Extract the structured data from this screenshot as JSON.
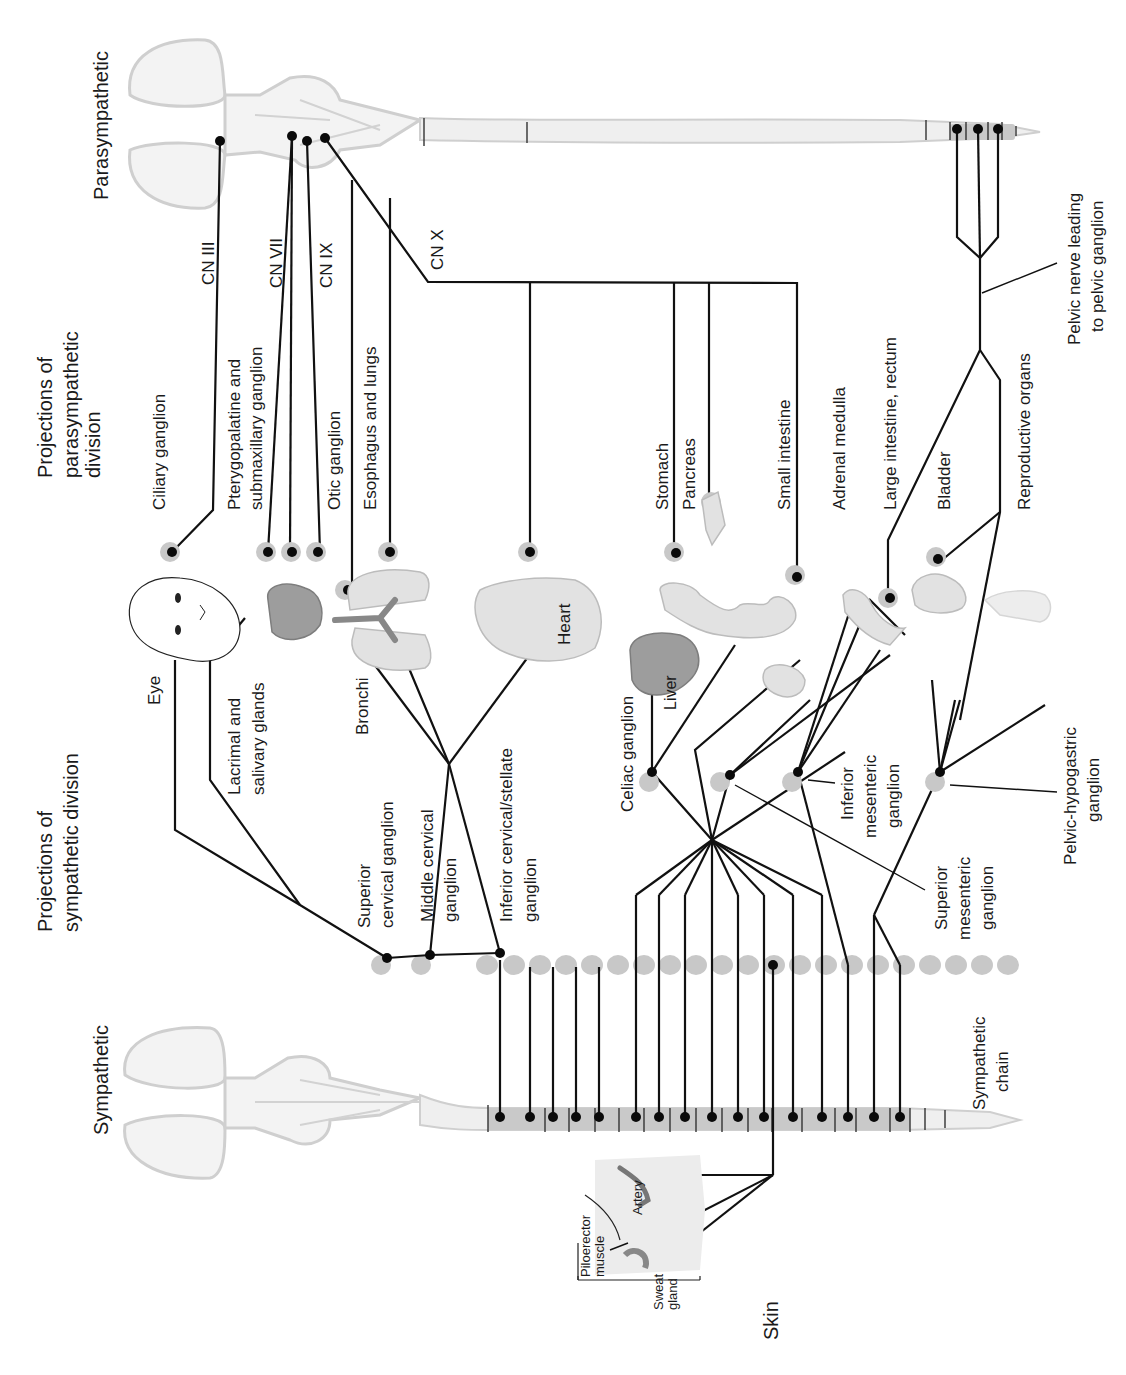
{
  "diagram": {
    "title_parasympathetic": "Parasympathetic",
    "title_sympathetic": "Sympathetic",
    "heading_parasympathetic": [
      "Projections of",
      "parasympathetic",
      "division"
    ],
    "heading_sympathetic": [
      "Projections of",
      "sympathetic division"
    ],
    "cranial_nerves": {
      "cn3": "CN III",
      "cn7": "CN VII",
      "cn9": "CN IX",
      "cn10": "CN X"
    },
    "parasympathetic_targets": {
      "ciliary": "Ciliary ganglion",
      "pterygo": [
        "Pterygopalatine and",
        "submaxillary ganglion"
      ],
      "otic": "Otic ganglion",
      "esophagus": "Esophagus and lungs",
      "stomach": "Stomach",
      "pancreas": "Pancreas",
      "small_intestine": "Small intestine",
      "adrenal": "Adrenal medulla",
      "large_intestine": "Large intestine, rectum",
      "bladder": "Bladder",
      "reproductive": "Reproductive organs",
      "pelvic_nerve": [
        "Pelvic nerve leading",
        "to pelvic ganglion"
      ]
    },
    "organs": {
      "eye": "Eye",
      "lacrimal": [
        "Lacrimal and",
        "salivary glands"
      ],
      "bronchi": "Bronchi",
      "heart": "Heart",
      "liver": "Liver"
    },
    "sympathetic_ganglia": {
      "superior_cervical": [
        "Superior",
        "cervical ganglion"
      ],
      "middle_cervical": [
        "Middle cervical",
        "ganglion"
      ],
      "inferior_cervical": [
        "Inferior cervical/stellate",
        "ganglion"
      ],
      "celiac": "Celiac ganglion",
      "superior_mesenteric": [
        "Superior",
        "mesenteric",
        "ganglion"
      ],
      "inferior_mesenteric": [
        "Inferior",
        "mesenteric",
        "ganglion"
      ],
      "pelvic_hypogastric": [
        "Pelvic-hypogastric",
        "ganglion"
      ],
      "chain": [
        "Sympathetic",
        "chain"
      ]
    },
    "skin": {
      "label": "Skin",
      "artery": "Artery",
      "piloerector": [
        "Piloerector",
        "muscle"
      ],
      "sweat": [
        "Sweat",
        "gland"
      ]
    },
    "colors": {
      "nerve": "#111111",
      "ganglion": "#c8c8c8",
      "cord": "#efefef",
      "cord_segment": "#c9c9c9"
    }
  }
}
